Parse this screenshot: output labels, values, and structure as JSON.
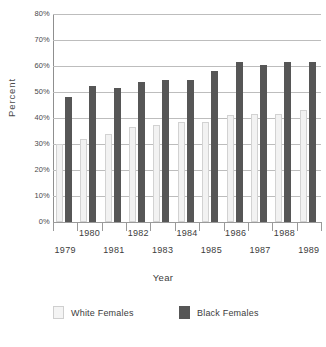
{
  "chart_data": {
    "type": "bar",
    "title": "",
    "xlabel": "Year",
    "ylabel": "Percent",
    "ylim": [
      0,
      80
    ],
    "ytick_labels": [
      "80%",
      "70%",
      "60%",
      "50%",
      "40%",
      "30%",
      "20%",
      "10%",
      "0%"
    ],
    "ytick_values": [
      80,
      70,
      60,
      50,
      40,
      30,
      20,
      10,
      0
    ],
    "grid": true,
    "legend_position": "bottom",
    "categories": [
      "1979",
      "1980",
      "1981",
      "1982",
      "1983",
      "1984",
      "1985",
      "1986",
      "1987",
      "1988",
      "1989"
    ],
    "category_rows": {
      "upper": [
        "1980",
        "1982",
        "1984",
        "1986",
        "1988"
      ],
      "lower": [
        "1979",
        "1981",
        "1983",
        "1985",
        "1987",
        "1989"
      ]
    },
    "series": [
      {
        "name": "White Females",
        "color": "#f2f2f2",
        "values": [
          30,
          32,
          34,
          36.5,
          37.5,
          38.5,
          38.5,
          41,
          41.5,
          41.5,
          43
        ]
      },
      {
        "name": "Black Females",
        "color": "#565656",
        "values": [
          48,
          52.5,
          51.5,
          54,
          54.5,
          54.5,
          58,
          61.5,
          60.5,
          61.5,
          61.5
        ]
      }
    ]
  },
  "axes": {
    "y_title": "Percent",
    "x_title": "Year"
  },
  "legend": {
    "items": [
      {
        "label": "White Females",
        "swatch": "legend-swatch-white-icon"
      },
      {
        "label": "Black Females",
        "swatch": "legend-swatch-black-icon"
      }
    ]
  }
}
